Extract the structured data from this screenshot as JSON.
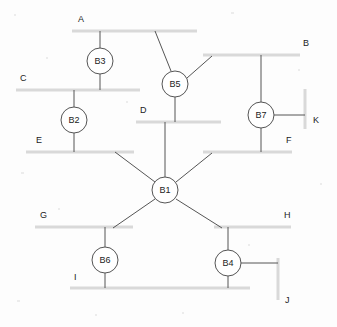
{
  "diagram": {
    "type": "network-topology",
    "colors": {
      "background": "#fdfdfd",
      "bus_bar": "#d9d9d9",
      "branch_line": "#555555",
      "node_fill": "#ffffff",
      "node_stroke": "#555555",
      "text": "#222222"
    },
    "buses": [
      {
        "id": "A",
        "label": "A",
        "orientation": "horizontal",
        "x1": 72,
        "y1": 31,
        "x2": 197,
        "y2": 31,
        "label_x": 78,
        "label_y": 22
      },
      {
        "id": "B",
        "label": "B",
        "orientation": "horizontal",
        "x1": 203,
        "y1": 55,
        "x2": 300,
        "y2": 55,
        "label_x": 303,
        "label_y": 46
      },
      {
        "id": "C",
        "label": "C",
        "orientation": "horizontal",
        "x1": 16,
        "y1": 90,
        "x2": 140,
        "y2": 90,
        "label_x": 20,
        "label_y": 81
      },
      {
        "id": "D",
        "label": "D",
        "orientation": "horizontal",
        "x1": 136,
        "y1": 122,
        "x2": 221,
        "y2": 122,
        "label_x": 140,
        "label_y": 113
      },
      {
        "id": "E",
        "label": "E",
        "orientation": "horizontal",
        "x1": 26,
        "y1": 152,
        "x2": 134,
        "y2": 152,
        "label_x": 36,
        "label_y": 143
      },
      {
        "id": "F",
        "label": "F",
        "orientation": "horizontal",
        "x1": 203,
        "y1": 152,
        "x2": 292,
        "y2": 152,
        "label_x": 286,
        "label_y": 143
      },
      {
        "id": "G",
        "label": "G",
        "orientation": "horizontal",
        "x1": 35,
        "y1": 227,
        "x2": 133,
        "y2": 227,
        "label_x": 40,
        "label_y": 218
      },
      {
        "id": "H",
        "label": "H",
        "orientation": "horizontal",
        "x1": 214,
        "y1": 227,
        "x2": 291,
        "y2": 227,
        "label_x": 284,
        "label_y": 218
      },
      {
        "id": "I",
        "label": "I",
        "orientation": "horizontal",
        "x1": 70,
        "y1": 288,
        "x2": 250,
        "y2": 288,
        "label_x": 74,
        "label_y": 280
      },
      {
        "id": "J",
        "label": "J",
        "orientation": "vertical",
        "x1": 278,
        "y1": 258,
        "x2": 278,
        "y2": 300,
        "label_x": 285,
        "label_y": 303
      },
      {
        "id": "K",
        "label": "K",
        "orientation": "vertical",
        "x1": 305,
        "y1": 89,
        "x2": 305,
        "y2": 129,
        "label_x": 313,
        "label_y": 123
      }
    ],
    "nodes": [
      {
        "id": "B1",
        "label": "B1",
        "cx": 165,
        "cy": 190,
        "r": 13
      },
      {
        "id": "B2",
        "label": "B2",
        "cx": 74,
        "cy": 120,
        "r": 13
      },
      {
        "id": "B3",
        "label": "B3",
        "cx": 100,
        "cy": 61,
        "r": 13
      },
      {
        "id": "B4",
        "label": "B4",
        "cx": 228,
        "cy": 263,
        "r": 13
      },
      {
        "id": "B5",
        "label": "B5",
        "cx": 175,
        "cy": 84,
        "r": 13
      },
      {
        "id": "B6",
        "label": "B6",
        "cx": 105,
        "cy": 260,
        "r": 13
      },
      {
        "id": "B7",
        "label": "B7",
        "cx": 261,
        "cy": 115,
        "r": 13
      }
    ],
    "branches": [
      {
        "id": "A-B3",
        "from": "A",
        "to": "B3",
        "x1": 100,
        "y1": 31,
        "x2": 100,
        "y2": 48
      },
      {
        "id": "B3-C",
        "from": "B3",
        "to": "C",
        "x1": 100,
        "y1": 74,
        "x2": 100,
        "y2": 90
      },
      {
        "id": "C-B2",
        "from": "C",
        "to": "B2",
        "x1": 74,
        "y1": 90,
        "x2": 74,
        "y2": 107
      },
      {
        "id": "B2-E",
        "from": "B2",
        "to": "E",
        "x1": 74,
        "y1": 133,
        "x2": 74,
        "y2": 152
      },
      {
        "id": "A-B5",
        "from": "A",
        "to": "B5",
        "x1": 155,
        "y1": 31,
        "x2": 171,
        "y2": 71
      },
      {
        "id": "B5-B",
        "from": "B5",
        "to": "B",
        "x1": 187,
        "y1": 78,
        "x2": 212,
        "y2": 56
      },
      {
        "id": "B5-D",
        "from": "B5",
        "to": "D",
        "x1": 175,
        "y1": 97,
        "x2": 175,
        "y2": 122
      },
      {
        "id": "B-B7",
        "from": "B",
        "to": "B7",
        "x1": 261,
        "y1": 55,
        "x2": 261,
        "y2": 102
      },
      {
        "id": "B7-K",
        "from": "B7",
        "to": "K",
        "x1": 274,
        "y1": 115,
        "x2": 305,
        "y2": 115
      },
      {
        "id": "B7-F",
        "from": "B7",
        "to": "F",
        "x1": 261,
        "y1": 128,
        "x2": 261,
        "y2": 152
      },
      {
        "id": "D-B1",
        "from": "D",
        "to": "B1",
        "x1": 165,
        "y1": 122,
        "x2": 165,
        "y2": 177
      },
      {
        "id": "E-B1",
        "from": "E",
        "to": "B1",
        "x1": 115,
        "y1": 152,
        "x2": 155,
        "y2": 182
      },
      {
        "id": "F-B1",
        "from": "F",
        "to": "B1",
        "x1": 212,
        "y1": 153,
        "x2": 176,
        "y2": 182
      },
      {
        "id": "B1-G",
        "from": "B1",
        "to": "G",
        "x1": 155,
        "y1": 199,
        "x2": 113,
        "y2": 228
      },
      {
        "id": "B1-H",
        "from": "B1",
        "to": "H",
        "x1": 176,
        "y1": 199,
        "x2": 222,
        "y2": 228
      },
      {
        "id": "G-B6",
        "from": "G",
        "to": "B6",
        "x1": 105,
        "y1": 227,
        "x2": 105,
        "y2": 247
      },
      {
        "id": "B6-I",
        "from": "B6",
        "to": "I",
        "x1": 105,
        "y1": 273,
        "x2": 105,
        "y2": 288
      },
      {
        "id": "H-B4",
        "from": "H",
        "to": "B4",
        "x1": 228,
        "y1": 227,
        "x2": 228,
        "y2": 250
      },
      {
        "id": "B4-J",
        "from": "B4",
        "to": "J",
        "x1": 241,
        "y1": 263,
        "x2": 278,
        "y2": 263
      },
      {
        "id": "B4-I",
        "from": "B4",
        "to": "I",
        "x1": 228,
        "y1": 276,
        "x2": 228,
        "y2": 288
      }
    ],
    "specks": [
      {
        "x": 14,
        "y": 14,
        "w": 2,
        "h": 2
      },
      {
        "x": 231,
        "y": 12,
        "w": 3,
        "h": 2
      },
      {
        "x": 46,
        "y": 57,
        "w": 2,
        "h": 2
      },
      {
        "x": 298,
        "y": 69,
        "w": 2,
        "h": 2
      },
      {
        "x": 126,
        "y": 101,
        "w": 2,
        "h": 2
      },
      {
        "x": 21,
        "y": 172,
        "w": 3,
        "h": 2
      },
      {
        "x": 320,
        "y": 183,
        "w": 2,
        "h": 2
      },
      {
        "x": 58,
        "y": 208,
        "w": 2,
        "h": 2
      },
      {
        "x": 248,
        "y": 244,
        "w": 2,
        "h": 2
      },
      {
        "x": 17,
        "y": 300,
        "w": 3,
        "h": 2
      },
      {
        "x": 182,
        "y": 312,
        "w": 2,
        "h": 2
      },
      {
        "x": 95,
        "y": 314,
        "w": 2,
        "h": 2
      }
    ]
  }
}
